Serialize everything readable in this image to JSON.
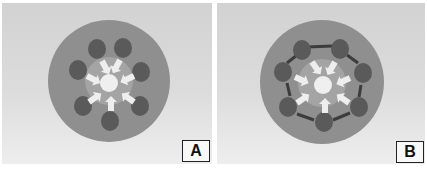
{
  "panels": [
    {
      "id": "A",
      "label": "A",
      "description": "Outer cells with arrows pointing inward to central cell",
      "outer_cell_count": 7,
      "inter_cell_arrows": false
    },
    {
      "id": "B",
      "label": "B",
      "description": "Outer cells with inward arrows plus bidirectional arrows between neighboring outer cells",
      "outer_cell_count": 7,
      "inter_cell_arrows": true
    }
  ],
  "colors": {
    "background_top": "#d2d2d2",
    "background_bottom": "#eeeeee",
    "disc": "#8f8f8f",
    "outer_cell": "#5a5a5a",
    "center_glow": "#a8a8a8",
    "center_cell": "#efefef",
    "inward_arrow": "#eeeeee",
    "link_arrow": "#3c3c3c"
  }
}
